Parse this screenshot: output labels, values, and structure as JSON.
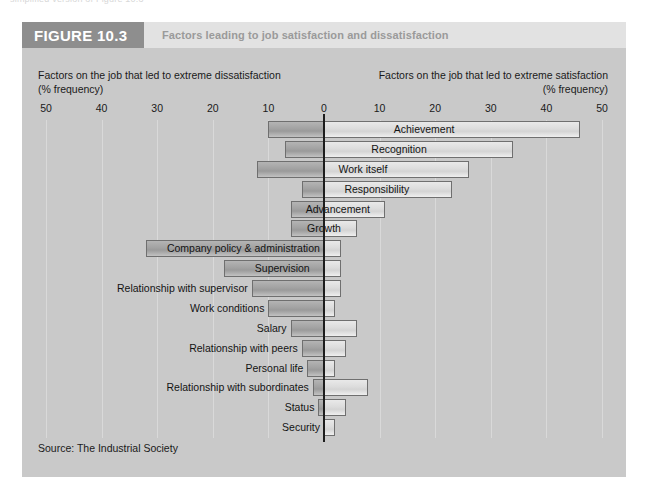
{
  "page": {
    "clipped_top_text": "simplified version of Figure 10.3"
  },
  "figure": {
    "badge": "FIGURE 10.3",
    "caption": "Factors leading to job satisfaction and dissatisfaction",
    "source": "Source: The Industrial Society"
  },
  "axis": {
    "left_heading_line1": "Factors on the job that led to extreme dissatisfaction",
    "left_heading_line2": "(% frequency)",
    "right_heading_line1": "Factors on the job that led to extreme satisfaction",
    "right_heading_line2": "(% frequency)",
    "tick_labels": [
      "50",
      "40",
      "30",
      "20",
      "10",
      "0",
      "10",
      "20",
      "30",
      "40",
      "50"
    ]
  },
  "colors": {
    "header_band": "#e2e2e2",
    "badge": "#8e8e8e",
    "caption_text": "#9a9a9a",
    "plot_background": "#c9c9c9",
    "dissatisfaction_bar": "#a2a2a2",
    "satisfaction_bar": "#dcdcdc",
    "zero_line": "#1d1d1d",
    "gridline": "#dcdcdc"
  },
  "chart_data": {
    "type": "bar",
    "title": "Factors leading to job satisfaction and dissatisfaction",
    "orientation": "horizontal-diverging",
    "xlabel": "% frequency",
    "ylabel": "",
    "xlim": [
      -50,
      50
    ],
    "xticks": [
      -50,
      -40,
      -30,
      -20,
      -10,
      0,
      10,
      20,
      30,
      40,
      50
    ],
    "grid": true,
    "legend_position": "none",
    "series": [
      {
        "name": "Factors on the job that led to extreme dissatisfaction",
        "axis_side": "left"
      },
      {
        "name": "Factors on the job that led to extreme satisfaction",
        "axis_side": "right"
      }
    ],
    "categories": [
      "Achievement",
      "Recognition",
      "Work itself",
      "Responsibility",
      "Advancement",
      "Growth",
      "Company policy & administration",
      "Supervision",
      "Relationship with supervisor",
      "Work conditions",
      "Salary",
      "Relationship with peers",
      "Personal life",
      "Relationship with subordinates",
      "Status",
      "Security"
    ],
    "bars": [
      {
        "label": "Achievement",
        "dissatisfaction": 10,
        "satisfaction": 46,
        "label_placement": "inside"
      },
      {
        "label": "Recognition",
        "dissatisfaction": 7,
        "satisfaction": 34,
        "label_placement": "inside"
      },
      {
        "label": "Work itself",
        "dissatisfaction": 12,
        "satisfaction": 26,
        "label_placement": "inside"
      },
      {
        "label": "Responsibility",
        "dissatisfaction": 4,
        "satisfaction": 23,
        "label_placement": "inside"
      },
      {
        "label": "Advancement",
        "dissatisfaction": 6,
        "satisfaction": 11,
        "label_placement": "inside"
      },
      {
        "label": "Growth",
        "dissatisfaction": 6,
        "satisfaction": 6,
        "label_placement": "inside"
      },
      {
        "label": "Company policy & administration",
        "dissatisfaction": 32,
        "satisfaction": 3,
        "label_placement": "inside"
      },
      {
        "label": "Supervision",
        "dissatisfaction": 18,
        "satisfaction": 3,
        "label_placement": "inside"
      },
      {
        "label": "Relationship with supervisor",
        "dissatisfaction": 13,
        "satisfaction": 3,
        "label_placement": "outside"
      },
      {
        "label": "Work conditions",
        "dissatisfaction": 10,
        "satisfaction": 2,
        "label_placement": "outside"
      },
      {
        "label": "Salary",
        "dissatisfaction": 6,
        "satisfaction": 6,
        "label_placement": "outside"
      },
      {
        "label": "Relationship with peers",
        "dissatisfaction": 4,
        "satisfaction": 4,
        "label_placement": "outside"
      },
      {
        "label": "Personal life",
        "dissatisfaction": 3,
        "satisfaction": 2,
        "label_placement": "outside"
      },
      {
        "label": "Relationship with subordinates",
        "dissatisfaction": 2,
        "satisfaction": 8,
        "label_placement": "outside"
      },
      {
        "label": "Status",
        "dissatisfaction": 1,
        "satisfaction": 4,
        "label_placement": "outside"
      },
      {
        "label": "Security",
        "dissatisfaction": 0,
        "satisfaction": 2,
        "label_placement": "outside"
      }
    ]
  }
}
